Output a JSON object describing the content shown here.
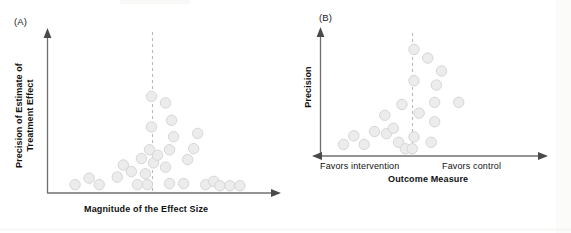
{
  "figure": {
    "type": "funnel-plot-pair",
    "background_color": "#ffffff",
    "dot_fill": "#ececed",
    "dot_stroke": "#d6d6d8",
    "axis_color": "#6f6f6f",
    "dashed_color": "#b9b9bb"
  },
  "panel_a": {
    "tag": "(A)",
    "y_axis_label_line1": "Precision of Estimate of",
    "y_axis_label_line2": "Treatment Effect",
    "x_axis_label": "Magnitude of the Effect Size",
    "chart_data": {
      "type": "scatter",
      "title": "(A)",
      "xlabel": "Magnitude of the Effect Size",
      "ylabel": "Precision of Estimate of Treatment Effect",
      "grid": false,
      "legend": false,
      "xlim": [
        0,
        100
      ],
      "ylim": [
        0,
        100
      ],
      "reference_line": {
        "orientation": "vertical",
        "x": 48,
        "style": "dashed"
      },
      "points": [
        {
          "x": 9,
          "y": 4
        },
        {
          "x": 16,
          "y": 10
        },
        {
          "x": 21,
          "y": 4
        },
        {
          "x": 30,
          "y": 11
        },
        {
          "x": 33,
          "y": 22
        },
        {
          "x": 37,
          "y": 16
        },
        {
          "x": 40,
          "y": 4
        },
        {
          "x": 42,
          "y": 28
        },
        {
          "x": 44,
          "y": 14
        },
        {
          "x": 45,
          "y": 4
        },
        {
          "x": 46,
          "y": 36
        },
        {
          "x": 47,
          "y": 57
        },
        {
          "x": 47,
          "y": 85
        },
        {
          "x": 48,
          "y": 24
        },
        {
          "x": 50,
          "y": 31
        },
        {
          "x": 54,
          "y": 79
        },
        {
          "x": 54,
          "y": 20
        },
        {
          "x": 56,
          "y": 36
        },
        {
          "x": 56,
          "y": 5
        },
        {
          "x": 57,
          "y": 63
        },
        {
          "x": 58,
          "y": 48
        },
        {
          "x": 63,
          "y": 5
        },
        {
          "x": 65,
          "y": 27
        },
        {
          "x": 68,
          "y": 37
        },
        {
          "x": 70,
          "y": 51
        },
        {
          "x": 74,
          "y": 4
        },
        {
          "x": 78,
          "y": 7
        },
        {
          "x": 81,
          "y": 3
        },
        {
          "x": 86,
          "y": 3
        },
        {
          "x": 91,
          "y": 3
        }
      ]
    }
  },
  "panel_b": {
    "tag": "(B)",
    "y_axis_label": "Precision",
    "x_axis_label": "Outcome Measure",
    "x_left_annotation": "Favors intervention",
    "x_right_annotation": "Favors control",
    "chart_data": {
      "type": "scatter",
      "title": "(B)",
      "xlabel": "Outcome Measure",
      "ylabel": "Precision",
      "grid": false,
      "legend": false,
      "xlim": [
        0,
        100
      ],
      "ylim": [
        0,
        100
      ],
      "reference_line": {
        "orientation": "vertical",
        "x": 50,
        "style": "dashed"
      },
      "annotations": [
        "Favors intervention",
        "Favors control"
      ],
      "points": [
        {
          "x": 9,
          "y": 7
        },
        {
          "x": 15,
          "y": 15
        },
        {
          "x": 21,
          "y": 7
        },
        {
          "x": 27,
          "y": 19
        },
        {
          "x": 33,
          "y": 34
        },
        {
          "x": 34,
          "y": 17
        },
        {
          "x": 38,
          "y": 22
        },
        {
          "x": 41,
          "y": 9
        },
        {
          "x": 43,
          "y": 44
        },
        {
          "x": 45,
          "y": 3
        },
        {
          "x": 49,
          "y": 3
        },
        {
          "x": 50,
          "y": 14
        },
        {
          "x": 50,
          "y": 66
        },
        {
          "x": 50,
          "y": 95
        },
        {
          "x": 53,
          "y": 36
        },
        {
          "x": 58,
          "y": 87
        },
        {
          "x": 60,
          "y": 9
        },
        {
          "x": 62,
          "y": 28
        },
        {
          "x": 62,
          "y": 46
        },
        {
          "x": 63,
          "y": 62
        },
        {
          "x": 66,
          "y": 75
        },
        {
          "x": 76,
          "y": 46
        }
      ]
    }
  }
}
